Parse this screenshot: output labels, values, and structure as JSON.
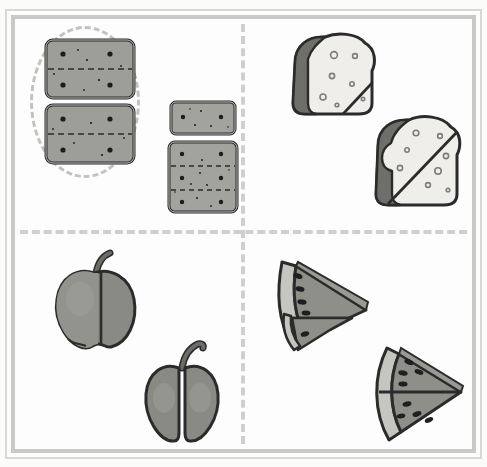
{
  "worksheet": {
    "title": "Equal and Unequal Parts — Food Items",
    "background_color": "#fdfdfd",
    "frame_color": "#c9c9c7",
    "divider_color": "#cfcfcd",
    "highlight_color": "#c2c2c0",
    "ghost_text_top": "strawberry",
    "ghost_text_left": "whole"
  },
  "layout": {
    "columns": 2,
    "rows": 2,
    "divider_style": "dashed",
    "quadrants": [
      {
        "id": "top-left",
        "label": "crackers-equal-parts"
      },
      {
        "id": "top-right",
        "label": "bread-slices"
      },
      {
        "id": "bottom-left",
        "label": "apples"
      },
      {
        "id": "bottom-right",
        "label": "watermelon-wedges"
      }
    ]
  },
  "selection": {
    "shape": "ellipse",
    "target": "cracker-stack-halves",
    "quadrant": "top-left",
    "style": "dashed-outline"
  },
  "items": [
    {
      "name": "cracker-top-halves",
      "quadrant": "top-left",
      "type": "cracker",
      "parts": 2,
      "equal": true,
      "selected": true,
      "fill": "#9e9e99",
      "stroke": "#2b2b2b"
    },
    {
      "name": "cracker-bottom-halves",
      "quadrant": "top-left",
      "type": "cracker",
      "parts": 2,
      "equal": true,
      "selected": true,
      "fill": "#9e9e99",
      "stroke": "#2b2b2b"
    },
    {
      "name": "cracker-small-whole",
      "quadrant": "top-left",
      "type": "cracker",
      "parts": 1,
      "equal": true,
      "selected": false,
      "fill": "#a3a39e",
      "stroke": "#2b2b2b"
    },
    {
      "name": "cracker-large-thirds",
      "quadrant": "top-left",
      "type": "cracker",
      "parts": 3,
      "equal": true,
      "selected": false,
      "fill": "#a3a39e",
      "stroke": "#2b2b2b"
    },
    {
      "name": "bread-slice-corner-cut",
      "quadrant": "top-right",
      "type": "bread-slice",
      "parts": 2,
      "equal": false,
      "selected": false,
      "fill": "#efeeea",
      "crust": "#6f6f6a",
      "stroke": "#2b2b2b"
    },
    {
      "name": "bread-slice-diagonal-half",
      "quadrant": "top-right",
      "type": "bread-slice",
      "parts": 2,
      "equal": true,
      "selected": false,
      "fill": "#efeeea",
      "crust": "#6f6f6a",
      "stroke": "#2b2b2b"
    },
    {
      "name": "apple-offcenter-cut",
      "quadrant": "bottom-left",
      "type": "apple",
      "parts": 2,
      "equal": false,
      "selected": false,
      "fill": "#8a8a85",
      "stem": "#55554f",
      "stroke": "#2b2b2b"
    },
    {
      "name": "apple-halves",
      "quadrant": "bottom-left",
      "type": "apple",
      "parts": 2,
      "equal": true,
      "selected": false,
      "fill": "#8a8a85",
      "stem": "#55554f",
      "stroke": "#2b2b2b"
    },
    {
      "name": "watermelon-unequal-cut",
      "quadrant": "bottom-right",
      "type": "watermelon-wedge",
      "parts": 2,
      "equal": false,
      "selected": false,
      "flesh": "#8f8f8a",
      "rind": "#c6c6c1",
      "seed": "#1f1f1f",
      "stroke": "#2b2b2b"
    },
    {
      "name": "watermelon-equal-halves",
      "quadrant": "bottom-right",
      "type": "watermelon-wedge",
      "parts": 2,
      "equal": true,
      "selected": false,
      "flesh": "#8f8f8a",
      "rind": "#c6c6c1",
      "seed": "#1f1f1f",
      "stroke": "#2b2b2b"
    }
  ]
}
